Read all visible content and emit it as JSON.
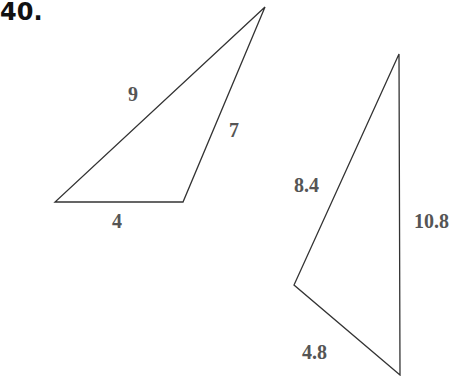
{
  "problem": {
    "number": "40."
  },
  "triangles": [
    {
      "name": "triangle-1",
      "vertices": [
        [
          55,
          202
        ],
        [
          183,
          202
        ],
        [
          265,
          7
        ]
      ],
      "sides": [
        {
          "label": "4",
          "x": 112,
          "y": 228
        },
        {
          "label": "7",
          "x": 229,
          "y": 137
        },
        {
          "label": "9",
          "x": 128,
          "y": 101
        }
      ]
    },
    {
      "name": "triangle-2",
      "vertices": [
        [
          399,
          54
        ],
        [
          294,
          285
        ],
        [
          400,
          375
        ]
      ],
      "sides": [
        {
          "label": "8.4",
          "x": 294,
          "y": 192
        },
        {
          "label": "10.8",
          "x": 414,
          "y": 228
        },
        {
          "label": "4.8",
          "x": 302,
          "y": 359
        }
      ]
    }
  ],
  "colors": {
    "edge": "#333333",
    "label": "#555555",
    "title": "#111111"
  }
}
